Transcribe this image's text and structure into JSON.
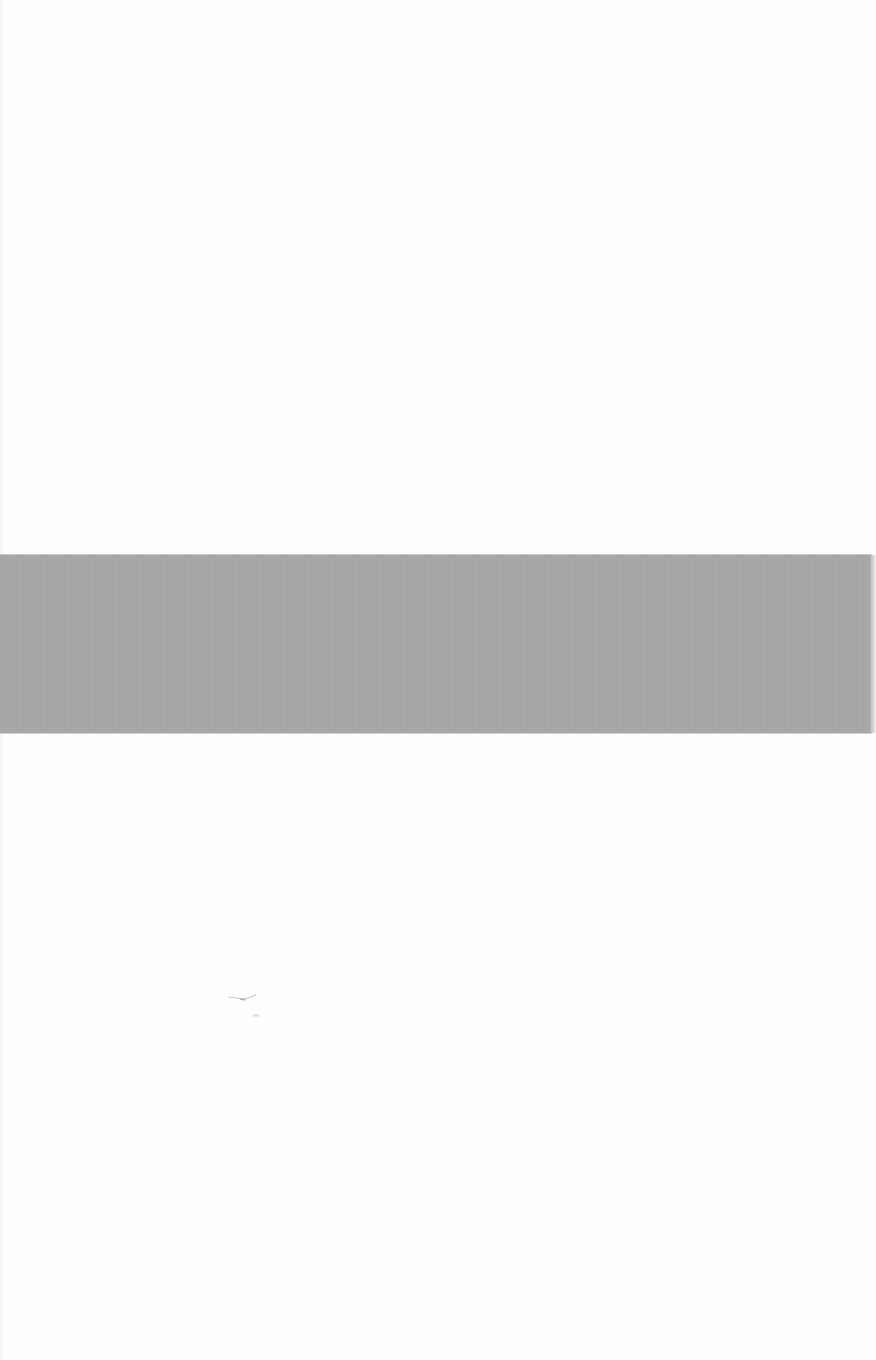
{
  "page": {
    "background_color": "#fefefe",
    "description": ""
  },
  "band": {
    "color": "#a9a9a9",
    "top_px": 555,
    "height_px": 178
  },
  "marks": {
    "smudge_color": "#9a9a9a"
  }
}
